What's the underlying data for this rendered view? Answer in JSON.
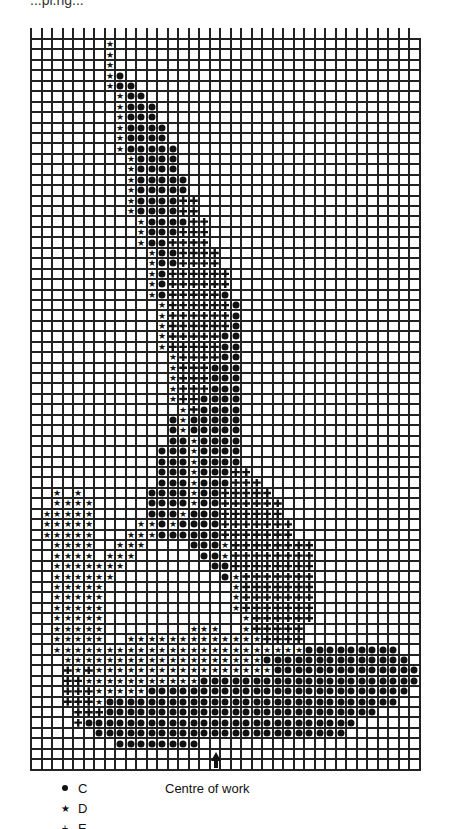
{
  "header": {
    "partial_text": "...pi.ng..."
  },
  "legend": [
    {
      "symbol": "dot",
      "label": "C"
    },
    {
      "symbol": "star",
      "label": "D"
    },
    {
      "symbol": "cross",
      "label": "E"
    }
  ],
  "annotation": {
    "centre_label": "Centre of work",
    "arrow_column": 18
  },
  "grid": {
    "columns": 37,
    "rows": 70
  },
  "chart_data": {
    "type": "table",
    "legend": {
      "C": "dot",
      "D": "star",
      "E": "cross (dark)"
    },
    "rows": [
      ".......D.............................",
      ".......D.............................",
      ".......D.............................",
      ".......DC............................",
      ".......DCC...........................",
      "........DCC..........................",
      "........DCCC.........................",
      "........DCCC.........................",
      "........DCCCC........................",
      "........DCCCC........................",
      "........DCCCCC.......................",
      ".........DCCCC.......................",
      ".........DCCCC.......................",
      ".........DCCCCC......................",
      ".........DCCCCC......................",
      ".........DCCCCEE.....................",
      ".........DCCCCEE.....................",
      "..........DCCCCEE....................",
      "..........DCCCEEE....................",
      "..........DCCEEEE....................",
      "...........DCCEEEE...................",
      "...........DCCEEEE...................",
      "...........DCEEEEEE..................",
      "...........DCEEEEEE..................",
      "...........DCEEEEEC..................",
      "............DEEEEEEC.................",
      "............DEEEEEEC.................",
      "............DEEEEEEC.................",
      "............DEEEEECC.................",
      "............DEEEEECC.................",
      ".............DEEEECC.................",
      ".............DEEECCC.................",
      ".............DEEECCC.................",
      ".............DEEECCC.................",
      ".............DEECCCC.................",
      "..............DECCCC.................",
      ".............CDCCCCC.................",
      ".............CDCCCCC.................",
      ".............CCDCCCC.................",
      "............CCCDCCCC.................",
      "............CCCDCCCC.................",
      "............CCCDCCCEE................",
      "............CCCDCCCEEE...............",
      "..D.D......CCCCDCCEEEEE..............",
      "..DDDD.....CCCCDCCEEEEEE.............",
      ".DDDDD.....CCCDCCCEEEEEE.............",
      ".DDDDD....DDCDCCCCEEEEEEE............",
      ".DDDDD...DDDCCCCCCEEEEEEE............",
      "..DDDD..DDD....CCCDEEEEEEEE..........",
      "..DDDD.DDD......CCDEEEEEEEE..........",
      "..DDDDDDD........CCEEEEEEEE..........",
      "..DDDDDD..........CDEEEEEEE..........",
      "..DDDDD............DEEEEEEE..........",
      "..DDDDD............DEEEEEEE..........",
      "..DDDDD............DEEEEEEE..........",
      "..DDDDD.............DEEEEEE..........",
      "..DDDDD........DDD..DEEEEE...........",
      "..DDDDD..DDDDDDDDDDDDDEEEE...........",
      "..DDDDDDDDDDDDDDDDDDDDDDDDCCCCCCCCC..",
      "...DDDDDDDDDDDDDDDDDDDCCCCCCCCCCCCCC.",
      "...EDEDDDDDDDDDDDDDDDDDCCCCCCCCCCCCCC",
      "...EEDDDDDDDDDDDCCCCCCCCCCCCCCCCCCCCC",
      "...EEEDDDDDCCCCCCCCCCCCCCCCCCCCCCCCC.",
      "...EEEDCCCCCCCCCCCCCCCCCCCCCCCCCCCC..",
      "....EEECCCCCCCCCCCCCCCCCCCCCCCCCC....",
      "....ECCCCCCCCCCCCCCCCCCCCCCCCCC......",
      "......CCCCCCCCCCCCCCCCCCCCCCCC.......",
      "........CCCCCCCC.....................",
      ".....................................",
      "....................................."
    ]
  }
}
